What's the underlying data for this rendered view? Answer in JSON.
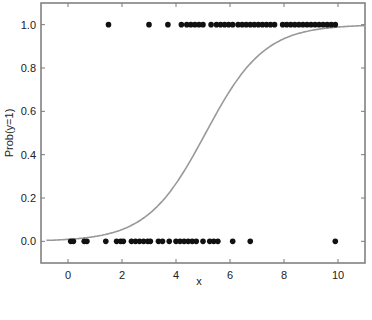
{
  "chart_data": {
    "type": "scatter",
    "title": "",
    "xlabel": "x",
    "ylabel": "Prob(y=1)",
    "xlim": [
      -1.0,
      11.0
    ],
    "ylim": [
      -0.1,
      1.1
    ],
    "xticks": [
      0,
      2,
      4,
      6,
      8,
      10
    ],
    "xtick_labels": [
      "0",
      "2",
      "4",
      "6",
      "8",
      "10"
    ],
    "yticks": [
      0.0,
      0.2,
      0.4,
      0.6,
      0.8,
      1.0
    ],
    "ytick_labels": [
      "0.0",
      "0.2",
      "0.4",
      "0.6",
      "0.8",
      "1.0"
    ],
    "grid": false,
    "legend": null,
    "series": [
      {
        "name": "observations y=1",
        "type": "scatter",
        "color": "#111111",
        "x": [
          1.5,
          3.0,
          3.7,
          4.2,
          4.4,
          4.55,
          4.7,
          4.85,
          5.0,
          5.3,
          5.5,
          5.65,
          5.8,
          5.95,
          6.1,
          6.3,
          6.45,
          6.6,
          6.75,
          6.9,
          7.05,
          7.2,
          7.35,
          7.5,
          7.65,
          7.95,
          8.1,
          8.25,
          8.4,
          8.55,
          8.7,
          8.85,
          9.0,
          9.15,
          9.3,
          9.45,
          9.6,
          9.75,
          9.9
        ],
        "y": [
          1,
          1,
          1,
          1,
          1,
          1,
          1,
          1,
          1,
          1,
          1,
          1,
          1,
          1,
          1,
          1,
          1,
          1,
          1,
          1,
          1,
          1,
          1,
          1,
          1,
          1,
          1,
          1,
          1,
          1,
          1,
          1,
          1,
          1,
          1,
          1,
          1,
          1,
          1
        ]
      },
      {
        "name": "observations y=0",
        "type": "scatter",
        "color": "#111111",
        "x": [
          0.1,
          0.2,
          0.6,
          0.7,
          1.4,
          1.8,
          1.95,
          2.05,
          2.35,
          2.5,
          2.65,
          2.8,
          2.95,
          3.05,
          3.35,
          3.5,
          3.75,
          4.0,
          4.15,
          4.3,
          4.45,
          4.6,
          4.75,
          5.0,
          5.25,
          5.4,
          5.55,
          6.1,
          6.75,
          9.9
        ],
        "y": [
          0,
          0,
          0,
          0,
          0,
          0,
          0,
          0,
          0,
          0,
          0,
          0,
          0,
          0,
          0,
          0,
          0,
          0,
          0,
          0,
          0,
          0,
          0,
          0,
          0,
          0,
          0,
          0,
          0,
          0
        ]
      },
      {
        "name": "logistic fit",
        "type": "line",
        "color": "#999999",
        "model": "1/(1+exp(-k*(x-x0)))",
        "k": 0.92,
        "x0": 5.1,
        "x": [
          -1,
          0,
          1,
          2,
          3,
          4,
          5,
          6,
          7,
          8,
          9,
          10,
          11
        ],
        "y": [
          0.004,
          0.009,
          0.022,
          0.055,
          0.126,
          0.266,
          0.477,
          0.696,
          0.852,
          0.935,
          0.973,
          0.989,
          0.996
        ]
      }
    ]
  }
}
